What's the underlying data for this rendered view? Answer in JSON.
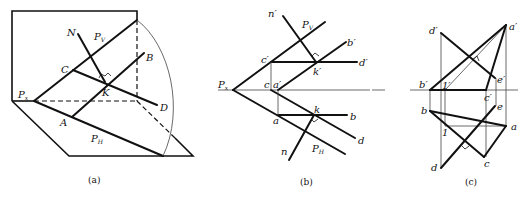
{
  "figure": {
    "panels": [
      {
        "id": "a",
        "caption": "(a)",
        "labels": {
          "N": "N",
          "Pv_main": "P",
          "Pv_sub": "V",
          "B": "B",
          "C": "C",
          "K": "K",
          "Px_main": "P",
          "Px_sub": "x",
          "D": "D",
          "A": "A",
          "PH_main": "P",
          "PH_sub": "H"
        }
      },
      {
        "id": "b",
        "caption": "(b)",
        "labels": {
          "n_prime": "n′",
          "Pv_main": "P",
          "Pv_sub": "V",
          "b_prime": "b′",
          "c_prime": "c′",
          "k_prime": "k′",
          "d_prime": "d′",
          "Px_main": "P",
          "Px_sub": "x",
          "c": "c",
          "a_prime": "a′",
          "k": "k",
          "a": "a",
          "b": "b",
          "d": "d",
          "n": "n",
          "PH_main": "P",
          "PH_sub": "H"
        }
      },
      {
        "id": "c",
        "caption": "(c)",
        "labels": {
          "d_prime": "d′",
          "a_prime": "a′",
          "e_prime": "e′",
          "b_prime": "b′",
          "one_prime": "1′",
          "c_prime": "c′",
          "e": "e",
          "b": "b",
          "a": "a",
          "one": "1",
          "c": "c",
          "d": "d"
        }
      }
    ]
  }
}
